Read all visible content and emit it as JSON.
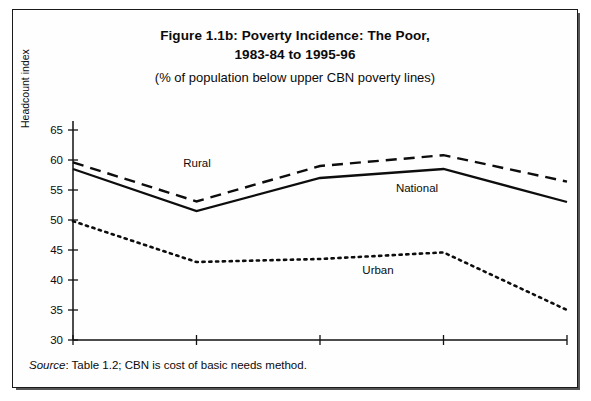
{
  "figure": {
    "title_line1": "Figure 1.1b: Poverty Incidence: The Poor,",
    "title_line2": "1983-84 to 1995-96",
    "subtitle": "(% of population below upper CBN poverty lines)",
    "source_word": "Source",
    "source_text": ": Table 1.2; CBN is cost of basic needs method."
  },
  "chart_data": {
    "type": "line",
    "title": "Figure 1.1b: Poverty Incidence: The Poor, 1983-84 to 1995-96",
    "subtitle": "(% of population below upper CBN poverty lines)",
    "xlabel": "",
    "ylabel": "Headcount index",
    "categories": [
      "1983-84",
      "1985-86",
      "1988-89",
      "1991-92",
      "1995-96"
    ],
    "ylim": [
      30,
      65
    ],
    "yticks": [
      30,
      35,
      40,
      45,
      50,
      55,
      60,
      65
    ],
    "grid": false,
    "legend": "inline-labels",
    "series": [
      {
        "name": "Rural",
        "style": "dashed",
        "color": "#0d0d0d",
        "values": [
          59.6,
          53.1,
          59.0,
          60.8,
          56.4
        ],
        "label_x": "1983-84",
        "label_position": {
          "x": 184,
          "y": 157
        }
      },
      {
        "name": "National",
        "style": "solid",
        "color": "#0d0d0d",
        "values": [
          58.5,
          51.5,
          57.0,
          58.5,
          53.0
        ],
        "label_position": {
          "x": 404,
          "y": 182
        }
      },
      {
        "name": "Urban",
        "style": "dotted",
        "color": "#0d0d0d",
        "values": [
          49.8,
          43.0,
          43.5,
          44.6,
          35.0
        ],
        "label_position": {
          "x": 365,
          "y": 264
        }
      }
    ]
  }
}
